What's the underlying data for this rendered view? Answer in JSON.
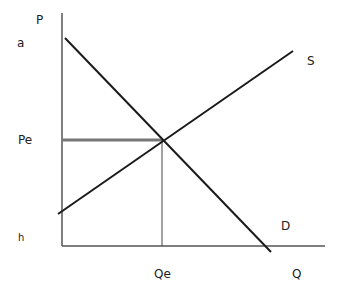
{
  "diagram": {
    "type": "supply-demand",
    "axes": {
      "y_label": "P",
      "x_label": "Q"
    },
    "labels": {
      "a": "a",
      "b": "h",
      "pe": "Pe",
      "qe": "Qe",
      "supply": "S",
      "demand": "D"
    },
    "colors": {
      "axis": "#555555",
      "curve": "#1a1a1a",
      "price_line": "#777777",
      "guide": "#444444",
      "text": "#222222"
    },
    "geometry": {
      "y_axis": {
        "x": 62,
        "y1": 13,
        "y2": 246
      },
      "x_axis": {
        "y": 246,
        "x1": 62,
        "x2": 325
      },
      "demand": {
        "x1": 65,
        "y1": 38,
        "x2": 271,
        "y2": 252
      },
      "supply": {
        "x1": 58,
        "y1": 214,
        "x2": 293,
        "y2": 51
      },
      "equilibrium": {
        "x": 162,
        "y": 140
      }
    }
  }
}
